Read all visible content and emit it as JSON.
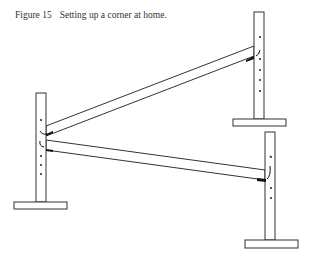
{
  "caption": {
    "label": "Figure 15",
    "text": "Setting up a corner at home."
  },
  "figure": {
    "stroke_color": "#333333",
    "fill_color": "#ffffff",
    "cup_color": "#111111",
    "standards": [
      {
        "name": "left",
        "post": {
          "x": 36,
          "y": 93,
          "w": 10,
          "h": 109
        },
        "base": {
          "x": 14,
          "y": 202,
          "w": 53,
          "h": 7
        }
      },
      {
        "name": "top-right",
        "post": {
          "x": 254,
          "y": 12,
          "w": 10,
          "h": 107
        },
        "base": {
          "x": 233,
          "y": 119,
          "w": 53,
          "h": 7
        }
      },
      {
        "name": "bottom-right",
        "post": {
          "x": 265,
          "y": 132,
          "w": 10,
          "h": 108
        },
        "base": {
          "x": 245,
          "y": 240,
          "w": 53,
          "h": 8
        }
      }
    ]
  }
}
